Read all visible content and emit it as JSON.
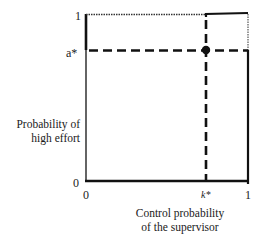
{
  "diagram": {
    "type": "step-function",
    "y_axis": {
      "label_line1": "Probability of",
      "label_line2": "high effort",
      "ticks": [
        "1",
        "a*",
        "0"
      ]
    },
    "x_axis": {
      "label_line1": "Control probability",
      "label_line2": "of the supervisor",
      "ticks": [
        "0",
        "k*",
        "1"
      ]
    },
    "points": [
      {
        "name": "equilibrium",
        "x": "k*",
        "y": "a*"
      }
    ],
    "colors": {
      "line": "#111111",
      "background": "#ffffff"
    }
  }
}
